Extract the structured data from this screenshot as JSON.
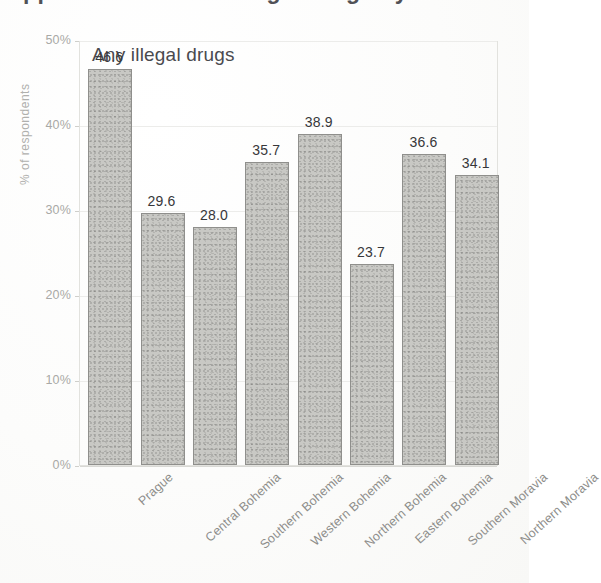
{
  "page": {
    "cut_off_heading": "Apparent .... wan of illegal drugs by ..."
  },
  "chart": {
    "title": "Any illegal drugs",
    "y_axis_label": "% of respondents"
  },
  "chart_data": {
    "type": "bar",
    "title": "Any illegal drugs",
    "xlabel": "",
    "ylabel": "% of respondents",
    "ylim": [
      0,
      50
    ],
    "ytick_labels": [
      "0%",
      "10%",
      "20%",
      "30%",
      "40%",
      "50%"
    ],
    "ytick_values": [
      0,
      10,
      20,
      30,
      40,
      50
    ],
    "grid": true,
    "legend": "none",
    "categories": [
      "Prague",
      "Central Bohemia",
      "Southern Bohemia",
      "Western Bohemia",
      "Northern Bohemia",
      "Eastern Bohemia",
      "Southern Moravia",
      "Northern Moravia"
    ],
    "values": [
      46.6,
      29.6,
      28.0,
      35.7,
      38.9,
      23.7,
      36.6,
      34.1
    ],
    "value_labels": [
      "46.6",
      "29.6",
      "28.0",
      "35.7",
      "38.9",
      "23.7",
      "36.6",
      "34.1"
    ],
    "colors": {
      "bar_fill": "#c8c8c4",
      "bar_border": "#8f8f8c",
      "gridline": "#ececea",
      "axis_text": "#a9a9a6",
      "value_text": "#37373a",
      "title_text": "#4a4a4e",
      "background": "#fdfdfc"
    }
  }
}
